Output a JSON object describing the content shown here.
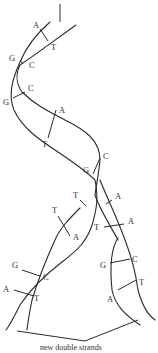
{
  "diagram": {
    "caption": "new double strands",
    "colors": {
      "line": "#2a2a2a",
      "text": "#333333",
      "background": "#ffffff"
    },
    "parent_helix_pairs": [
      {
        "left": "A",
        "right": "T"
      },
      {
        "left": "G",
        "right": "C"
      },
      {
        "left": "G",
        "right": "C"
      },
      {
        "left": "A",
        "right": "T"
      },
      {
        "left": "G",
        "right": "C"
      }
    ],
    "left_daughter_pairs": [
      {
        "left": "T",
        "right": "A"
      },
      {
        "left": "G",
        "right": "C"
      },
      {
        "left": "A",
        "right": "T"
      }
    ],
    "right_daughter_pairs": [
      {
        "left": "T",
        "right": "A"
      },
      {
        "left": "G",
        "right": "C"
      },
      {
        "left": "A",
        "right": "T"
      }
    ],
    "unpaired_bases": [
      {
        "base": "T",
        "strand": "left-new"
      },
      {
        "base": "A",
        "strand": "right-new"
      }
    ]
  }
}
